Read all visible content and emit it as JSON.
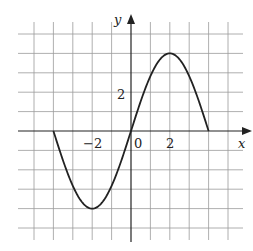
{
  "chart_data": {
    "type": "line",
    "title": "",
    "xlabel": "x",
    "ylabel": "y",
    "xlim": [
      -5,
      5
    ],
    "ylim": [
      -5,
      5
    ],
    "grid": true,
    "tick_labels": {
      "x": [
        "-2",
        "0",
        "2"
      ],
      "y": [
        "2"
      ]
    },
    "series": [
      {
        "name": "f(x)",
        "x": [
          -4,
          -3,
          -2,
          -1,
          0,
          1,
          2,
          3,
          4
        ],
        "y": [
          0,
          -2.8,
          -4,
          -2.8,
          0,
          2.8,
          4,
          2.8,
          0
        ]
      }
    ],
    "key_points": {
      "zeros": [
        -4,
        0,
        4
      ],
      "minimum": [
        -2,
        -4
      ],
      "maximum": [
        2,
        4
      ]
    }
  },
  "labels": {
    "x_axis": "x",
    "y_axis": "y",
    "origin": "0",
    "x_tick_neg2": "−2",
    "x_tick_2": "2",
    "y_tick_2": "2"
  }
}
